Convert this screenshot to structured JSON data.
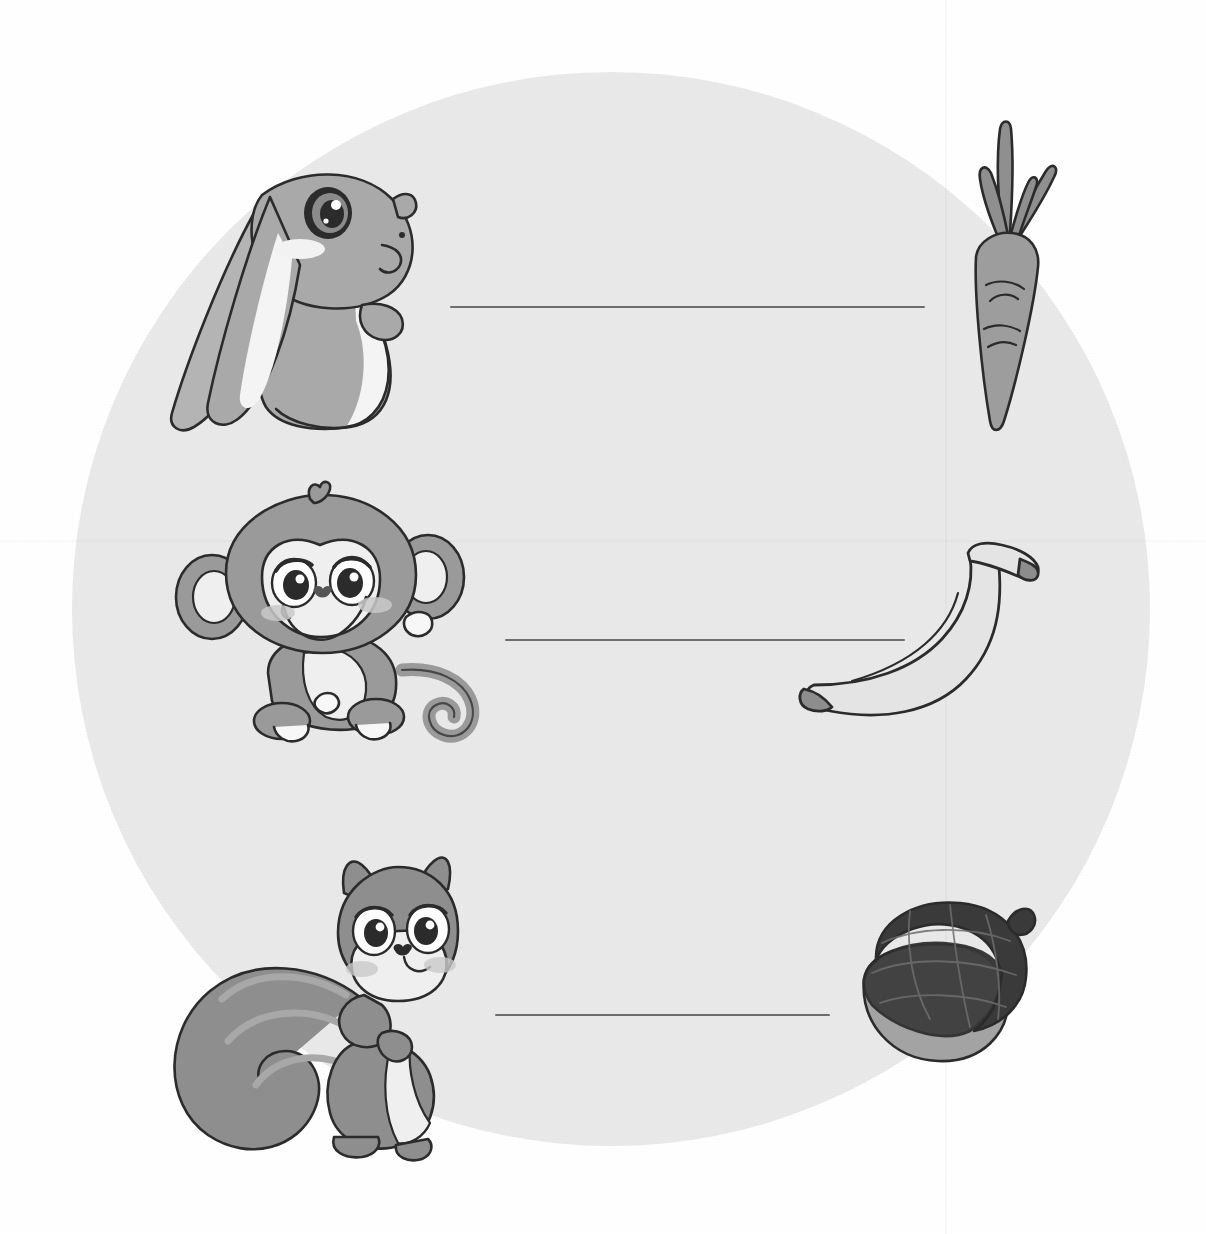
{
  "worksheet": {
    "type": "matching-activity",
    "title_visible": false,
    "background_shape": "circle",
    "background_color": "#e9e9e9",
    "page_color": "#ffffff",
    "width": 1206,
    "height": 1234
  },
  "palette": {
    "outline": "#2b2b2b",
    "line": "#6d6d6d",
    "rabbit_body": "#a9a9a9",
    "rabbit_light": "#f4f4f4",
    "rabbit_blush": "#f0f0f0",
    "monkey_fur": "#9a9a9a",
    "monkey_face": "#f0f0f0",
    "monkey_blush": "#c9c9c9",
    "squirrel_body": "#8e8e8e",
    "squirrel_tail_stripe": "#a8a8a8",
    "squirrel_face": "#efefef",
    "carrot_body": "#9d9d9d",
    "carrot_leaf": "#8f8f8f",
    "banana_body": "#e4e4e4",
    "banana_tip": "#8d8d8d",
    "acorn_cap": "#3a3a3a",
    "acorn_nut": "#a3a3a3",
    "eye_dark": "#2b2b2b",
    "eye_white": "#ffffff"
  },
  "animals": [
    {
      "id": "rabbit",
      "name": "rabbit",
      "row": 1,
      "side": "left"
    },
    {
      "id": "monkey",
      "name": "monkey",
      "row": 2,
      "side": "left"
    },
    {
      "id": "squirrel",
      "name": "squirrel",
      "row": 3,
      "side": "left"
    }
  ],
  "foods": [
    {
      "id": "carrot",
      "name": "carrot",
      "row": 1,
      "side": "right"
    },
    {
      "id": "banana",
      "name": "banana",
      "row": 2,
      "side": "right"
    },
    {
      "id": "acorn",
      "name": "acorn",
      "row": 3,
      "side": "right"
    }
  ],
  "match_lines": [
    {
      "id": "line-1",
      "row": 1,
      "x1": 450,
      "y1": 307,
      "x2": 925,
      "y2": 307,
      "connects": "rabbit-to-carrot"
    },
    {
      "id": "line-2",
      "row": 2,
      "x1": 505,
      "y1": 640,
      "x2": 905,
      "y2": 640,
      "connects": "monkey-to-banana"
    },
    {
      "id": "line-3",
      "row": 3,
      "x1": 495,
      "y1": 1015,
      "x2": 830,
      "y2": 1015,
      "connects": "squirrel-to-acorn"
    }
  ]
}
